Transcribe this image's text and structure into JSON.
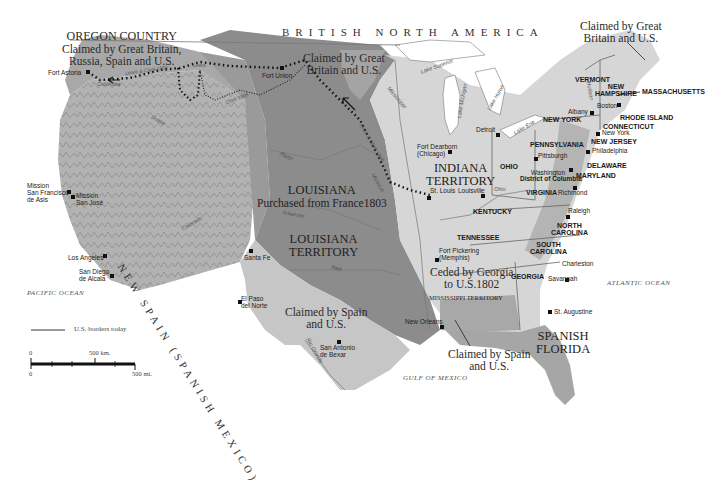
{
  "map": {
    "title_regions": {
      "british_north_america": "BRITISH NORTH AMERICA",
      "oregon_country": {
        "name": "OREGON COUNTRY",
        "sub1": "Claimed by Great Britain,",
        "sub2": "Russia, Spain and U.S."
      },
      "claimed_gb_us_north": {
        "line1": "Claimed by Great",
        "line2": "Britain and U.S."
      },
      "claimed_gb_us_maine": {
        "line1": "Claimed by Great",
        "line2": "Britain and U.S."
      },
      "louisiana_purchase": {
        "line1": "LOUISIANA",
        "line2": "Purchased from France1803"
      },
      "louisiana_territory": {
        "line1": "LOUISIANA",
        "line2": "TERRITORY"
      },
      "indiana_territory": {
        "line1": "INDIANA",
        "line2": "TERRITORY"
      },
      "ceded_georgia": {
        "line1": "Ceded by Georgia",
        "line2": "to U.S.1802"
      },
      "mississippi_territory": "MISSISSIPPI TERRITORY",
      "claimed_spain_us_texas": {
        "line1": "Claimed by Spain",
        "line2": "and U.S."
      },
      "claimed_spain_us_gulf": {
        "line1": "Claimed by Spain",
        "line2": "and U.S."
      },
      "spanish_florida": {
        "line1": "SPANISH",
        "line2": "FLORIDA"
      },
      "new_spain": "NEW SPAIN (SPANISH MEXICO)"
    },
    "states": {
      "vermont": "VERMONT",
      "new_hampshire": {
        "line1": "NEW",
        "line2": "HAMPSHIRE"
      },
      "massachusetts": "MASSACHUSETTS",
      "rhode_island": "RHODE ISLAND",
      "connecticut": "CONNECTICUT",
      "new_york": "NEW YORK",
      "new_jersey": "NEW JERSEY",
      "pennsylvania": "PENNSYLVANIA",
      "delaware": "DELAWARE",
      "maryland": "MARYLAND",
      "district_of_columbia": "District of Columbia",
      "ohio": "OHIO",
      "virginia": "VIRGINIA",
      "kentucky": "KENTUCKY",
      "tennessee": "TENNESSEE",
      "north_carolina": {
        "line1": "NORTH",
        "line2": "CAROLINA"
      },
      "south_carolina": {
        "line1": "SOUTH",
        "line2": "CAROLINA"
      },
      "georgia": "GEORGIA"
    },
    "cities": {
      "fort_astoria": "Fort Astoria",
      "fort_union": "Fort Union",
      "fort_dearborn": {
        "line1": "Fort Dearborn",
        "line2": "(Chicago)"
      },
      "detroit": "Detroit",
      "albany": "Albany",
      "boston": "Boston",
      "new_york": "New York",
      "philadelphia": "Philadelphia",
      "pittsburgh": "Pittsburgh",
      "washington": "Washington",
      "richmond": "Richmond",
      "raleigh": "Raleigh",
      "charleston": "Charleston",
      "savannah": "Savannah",
      "st_augustine": "St. Augustine",
      "louisville": "Louisville",
      "st_louis": "St. Louis",
      "fort_pickering": {
        "line1": "Fort Pickering",
        "line2": "(Memphis)"
      },
      "new_orleans": "New Orleans",
      "santa_fe": "Santa Fe",
      "el_paso": {
        "line1": "El Paso",
        "line2": "del Norte"
      },
      "san_antonio": {
        "line1": "San Antonio",
        "line2": "de Bexar"
      },
      "mission_sf": {
        "line1": "Mission",
        "line2": "San Francisco",
        "line3": "de Asis"
      },
      "mission_sj": {
        "line1": "Mission",
        "line2": "San José"
      },
      "los_angeles": "Los Angeles",
      "san_diego": {
        "line1": "San Diego",
        "line2": "de Alcala"
      }
    },
    "water": {
      "pacific": "PACIFIC OCEAN",
      "atlantic": "ATLANTIC OCEAN",
      "gulf": "GULF OF MEXICO",
      "lake_superior": "Lake Superior",
      "lake_michigan": "Lake Michigan",
      "lake_huron": "Lake Huron",
      "lake_erie": "Lake Erie",
      "mississippi": "Mississippi",
      "missouri": "Missouri",
      "platte": "Platte",
      "arkansas": "Arkansas",
      "red": "Red",
      "rio_grande": "Rio Grande",
      "ohio_river": "Ohio",
      "columbia": "Columbia",
      "hudson": "Hudson",
      "colorado": "Colorado",
      "snake": "Snake"
    },
    "routes": {
      "lewis_clark_1805": "Lewis & Clark 1805",
      "lewis_clark_1804": "Lewis & Clark 1804",
      "clark_1806": "Clark 1806",
      "lewis_1806": "Lewis"
    },
    "legend": {
      "borders_label": "U.S. borders today",
      "scale_km_zero": "0",
      "scale_km_label": "500 km.",
      "scale_mi_zero": "0",
      "scale_mi_label": "500 mi."
    },
    "colors": {
      "louisiana_fill": "#8a8a8a",
      "us_fill": "#d8d8d8",
      "spain_fill": "#c4c4c4",
      "claimed_fill": "#b0b0b0",
      "oregon_fill": "#a6a6a6",
      "route_color": "#111111",
      "background": "#ffffff"
    }
  }
}
